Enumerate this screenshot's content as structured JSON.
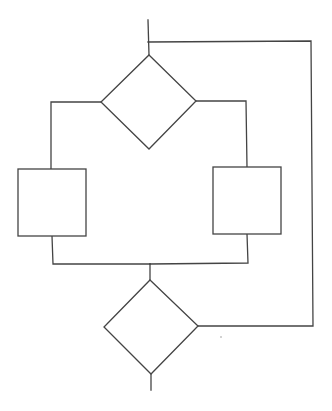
{
  "diagram": {
    "type": "flowchart",
    "colors": {
      "background": "#ffffff",
      "stroke": "#444444",
      "speck": "#9a9a9a"
    },
    "nodes": [
      {
        "id": "decision-top",
        "shape": "diamond",
        "label": "",
        "top": [
          149,
          55
        ],
        "right": [
          196,
          101
        ],
        "bottom": [
          149,
          149
        ],
        "left": [
          101,
          102
        ]
      },
      {
        "id": "process-left",
        "shape": "rectangle",
        "label": "",
        "x": 18,
        "y": 169,
        "width": 68,
        "height": 67
      },
      {
        "id": "process-right",
        "shape": "rectangle",
        "label": "",
        "x": 213,
        "y": 167,
        "width": 68,
        "height": 67
      },
      {
        "id": "decision-bottom",
        "shape": "diamond",
        "label": "",
        "top": [
          150,
          280
        ],
        "right": [
          198,
          326
        ],
        "bottom": [
          151,
          374
        ],
        "left": [
          104,
          327
        ]
      }
    ],
    "edges": [
      {
        "id": "entry",
        "from": "start",
        "to": "decision-top",
        "points": [
          [
            148,
            20
          ],
          [
            149,
            55
          ]
        ]
      },
      {
        "id": "left-branch",
        "from": "decision-top",
        "to": "process-left",
        "points": [
          [
            101,
            102
          ],
          [
            51,
            102
          ],
          [
            51,
            169
          ]
        ]
      },
      {
        "id": "right-branch",
        "from": "decision-top",
        "to": "process-right",
        "points": [
          [
            196,
            101
          ],
          [
            246,
            101
          ],
          [
            247,
            167
          ]
        ]
      },
      {
        "id": "left-merge",
        "from": "process-left",
        "to": "merge",
        "points": [
          [
            52,
            236
          ],
          [
            53,
            264
          ],
          [
            150,
            264
          ]
        ]
      },
      {
        "id": "right-merge",
        "from": "process-right",
        "to": "merge",
        "points": [
          [
            247,
            234
          ],
          [
            248,
            263
          ],
          [
            150,
            264
          ]
        ]
      },
      {
        "id": "merge-down",
        "from": "merge",
        "to": "decision-bottom",
        "points": [
          [
            150,
            264
          ],
          [
            150,
            280
          ]
        ]
      },
      {
        "id": "loop-back",
        "from": "decision-bottom",
        "to": "entry",
        "points": [
          [
            198,
            326
          ],
          [
            313,
            326
          ],
          [
            311,
            41
          ],
          [
            148,
            42
          ]
        ]
      },
      {
        "id": "exit",
        "from": "decision-bottom",
        "to": "end",
        "points": [
          [
            151,
            374
          ],
          [
            151,
            390
          ]
        ]
      }
    ]
  }
}
